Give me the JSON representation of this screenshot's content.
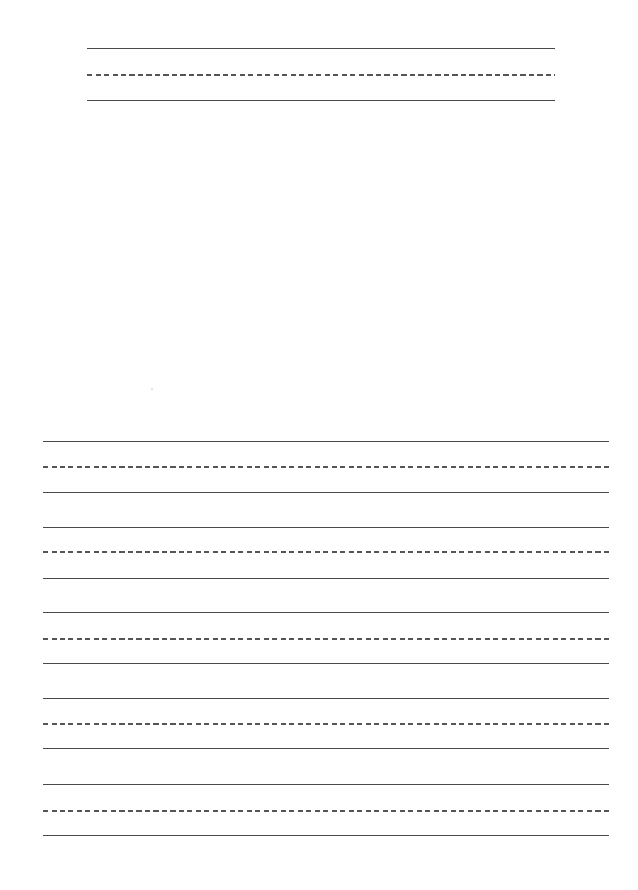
{
  "page": {
    "type": "handwriting-practice-sheet",
    "background": "#ffffff",
    "line_color": "#4a4a4a",
    "dash_color": "#555555"
  },
  "title_block": {
    "x_start": 87,
    "x_end": 555,
    "lines": [
      {
        "style": "solid",
        "y": 48
      },
      {
        "style": "dashed",
        "y": 74
      },
      {
        "style": "solid",
        "y": 100
      }
    ]
  },
  "writing_blocks": {
    "x_start": 43,
    "x_end": 609,
    "blocks": [
      {
        "top": 441,
        "mid": 466,
        "bottom": 492
      },
      {
        "top": 527,
        "mid": 551,
        "bottom": 578
      },
      {
        "top": 612,
        "mid": 638,
        "bottom": 663
      },
      {
        "top": 698,
        "mid": 723,
        "bottom": 748
      },
      {
        "top": 784,
        "mid": 810,
        "bottom": 835
      }
    ]
  }
}
